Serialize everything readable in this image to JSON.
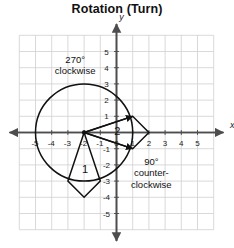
{
  "title": "Rotation (Turn)",
  "axes": {
    "x_name": "x",
    "y_name": "y",
    "x_ticks": [
      "-5",
      "-4",
      "-3",
      "-2",
      "-1",
      "0",
      "1",
      "2",
      "3",
      "4",
      "5"
    ],
    "y_ticks": [
      "5",
      "4",
      "3",
      "2",
      "1",
      "0",
      "-1",
      "-2",
      "-3",
      "-4",
      "-5"
    ],
    "xlim": [
      -6,
      6
    ],
    "ylim": [
      -6,
      6
    ],
    "grid": true,
    "grid_color": "#cfcfcf",
    "axis_color": "#4d4d4d"
  },
  "annotations": {
    "clockwise_line1": "270°",
    "clockwise_line2": "clockwise",
    "counter_line1": "90°",
    "counter_line2": "counter-",
    "counter_line3": "clockwise"
  },
  "shape_labels": {
    "shape1": "1",
    "shape2": "2"
  },
  "chart_data": {
    "type": "scatter",
    "title": "Rotation (Turn)",
    "xlabel": "x",
    "ylabel": "y",
    "xlim": [
      -6,
      6
    ],
    "ylim": [
      -6,
      6
    ],
    "grid": true,
    "center_of_rotation": [
      -2,
      0
    ],
    "circle": {
      "center": [
        -2,
        0
      ],
      "radius": 3,
      "color": "#111111"
    },
    "shapes": [
      {
        "name": "1",
        "label_pos": [
          -2,
          -2.2
        ],
        "vertices": [
          [
            -2,
            0
          ],
          [
            -3,
            -3
          ],
          [
            -2,
            -4
          ],
          [
            -1,
            -3
          ]
        ],
        "color": "#111111"
      },
      {
        "name": "2",
        "label_pos": [
          0.1,
          0.1
        ],
        "vertices": [
          [
            -2,
            0
          ],
          [
            1,
            1
          ],
          [
            2,
            0
          ],
          [
            1,
            -1
          ]
        ],
        "color": "#111111"
      }
    ],
    "arrows": [
      {
        "from": [
          -2,
          0
        ],
        "to": [
          1,
          1
        ]
      },
      {
        "from": [
          -2,
          0
        ],
        "to": [
          1,
          -1
        ]
      }
    ],
    "annotations": [
      {
        "text": "270° clockwise",
        "pos": [
          -2.6,
          4.4
        ]
      },
      {
        "text": "90° counter-clockwise",
        "pos": [
          2.1,
          -2.2
        ]
      }
    ]
  }
}
